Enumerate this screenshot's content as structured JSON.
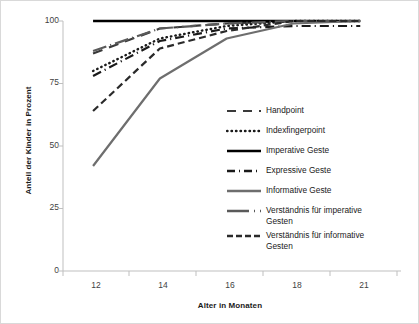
{
  "chart_data": {
    "type": "line",
    "title": "",
    "xlabel": "Alter in Monaten",
    "ylabel": "Anteil der Kinder in Prozent",
    "categories": [
      "12",
      "14",
      "16",
      "18",
      "21"
    ],
    "x": [
      12,
      14,
      16,
      18,
      21
    ],
    "xtick_labels": [
      "12",
      "14",
      "16",
      "18",
      "21"
    ],
    "ytick_labels": [
      "0",
      "25",
      "50",
      "75",
      "100"
    ],
    "yticks": [
      0,
      25,
      50,
      75,
      100
    ],
    "ylim": [
      0,
      100
    ],
    "grid": false,
    "legend_position": "center-right",
    "series": [
      {
        "name": "Handpoint",
        "style": "long-dash",
        "color": "#3a3a3a",
        "values": [
          87,
          97,
          99,
          100,
          100
        ]
      },
      {
        "name": "Indexfingerpoint",
        "style": "dotted",
        "color": "#1a1a1a",
        "values": [
          80,
          93,
          98,
          100,
          100
        ]
      },
      {
        "name": "Imperative Geste",
        "style": "solid",
        "color": "#000000",
        "values": [
          100,
          100,
          100,
          100,
          100
        ]
      },
      {
        "name": "Expressive Geste",
        "style": "dash-dot",
        "color": "#1a1a1a",
        "values": [
          78,
          92,
          97,
          98,
          98
        ]
      },
      {
        "name": "Informative Geste",
        "style": "solid-gray",
        "color": "#6e6e6e",
        "values": [
          42,
          77,
          93,
          99,
          100
        ]
      },
      {
        "name": "Verständnis für imperative\nGesten",
        "style": "dash-dot-gray",
        "color": "#5a5a5a",
        "values": [
          88,
          97,
          99,
          100,
          100
        ]
      },
      {
        "name": "Verständnis für informative\nGesten",
        "style": "medium-dash",
        "color": "#2a2a2a",
        "values": [
          64,
          89,
          96,
          100,
          100
        ]
      }
    ]
  },
  "legend": {
    "items": [
      {
        "label": "Handpoint",
        "swatch": "long-dash-swatch"
      },
      {
        "label": "Indexfingerpoint",
        "swatch": "dotted-swatch"
      },
      {
        "label": "Imperative Geste",
        "swatch": "solid-swatch"
      },
      {
        "label": "Expressive Geste",
        "swatch": "dash-dot-swatch"
      },
      {
        "label": "Informative Geste",
        "swatch": "solid-gray-swatch"
      },
      {
        "label": "Verständnis für imperative\nGesten",
        "swatch": "dash-dot-gray-swatch"
      },
      {
        "label": "Verständnis für informative\nGesten",
        "swatch": "medium-dash-swatch"
      }
    ]
  },
  "axes": {
    "y_title": "Anteil der Kinder in Prozent",
    "x_title": "Alter in Monaten",
    "y_labels": {
      "t0": "0",
      "t1": "25",
      "t2": "50",
      "t3": "75",
      "t4": "100"
    },
    "x_labels": {
      "t0": "12",
      "t1": "14",
      "t2": "16",
      "t3": "18",
      "t4": "21"
    }
  }
}
